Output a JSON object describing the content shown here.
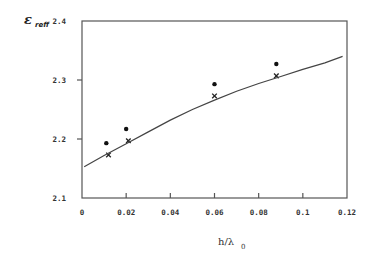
{
  "chart_data": {
    "type": "scatter",
    "title": "",
    "xlabel": "h/λ",
    "xlabel_subscript": "0",
    "ylabel": "ε",
    "ylabel_subscript": "reff",
    "xlim": [
      0,
      0.12
    ],
    "ylim": [
      2.1,
      2.4
    ],
    "x_ticks": [
      0,
      0.02,
      0.04,
      0.06,
      0.08,
      0.1,
      0.12
    ],
    "x_tick_labels": [
      "0",
      "0.02",
      "0.04",
      "0.06",
      "0.08",
      "0.1",
      "0.12"
    ],
    "y_ticks": [
      2.1,
      2.2,
      2.3,
      2.4
    ],
    "y_tick_labels": [
      "2.1",
      "2.2",
      "2.3",
      "2.4"
    ],
    "grid": false,
    "legend": "none",
    "series": [
      {
        "name": "dots",
        "marker": "circle",
        "x": [
          0.011,
          0.02,
          0.06,
          0.088
        ],
        "y": [
          2.193,
          2.217,
          2.293,
          2.327
        ]
      },
      {
        "name": "crosses",
        "marker": "x",
        "x": [
          0.012,
          0.021,
          0.06,
          0.088
        ],
        "y": [
          2.173,
          2.197,
          2.273,
          2.307
        ]
      },
      {
        "name": "curve",
        "marker": "line",
        "x": [
          0.001,
          0.01,
          0.02,
          0.03,
          0.04,
          0.05,
          0.06,
          0.07,
          0.08,
          0.09,
          0.1,
          0.11,
          0.118
        ],
        "y": [
          2.153,
          2.172,
          2.192,
          2.212,
          2.232,
          2.25,
          2.266,
          2.281,
          2.294,
          2.306,
          2.318,
          2.329,
          2.34
        ]
      }
    ]
  }
}
